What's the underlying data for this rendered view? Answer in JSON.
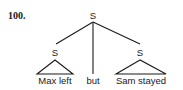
{
  "example_number": "100.",
  "tree": {
    "root": {
      "label": "S"
    },
    "children": [
      {
        "label": "S",
        "type": "triangle",
        "leaf": "Max left"
      },
      {
        "label": null,
        "type": "line",
        "leaf": "but"
      },
      {
        "label": "S",
        "type": "triangle",
        "leaf": "Sam stayed"
      }
    ]
  },
  "colors": {
    "ink": "#1a1a1a",
    "background": "#ffffff"
  }
}
